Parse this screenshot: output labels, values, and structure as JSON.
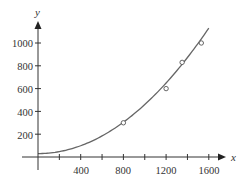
{
  "chart_data": {
    "type": "scatter",
    "title": "",
    "xlabel": "x",
    "ylabel": "y",
    "xlim": [
      0,
      1700
    ],
    "ylim": [
      0,
      1150
    ],
    "grid": false,
    "legend": null,
    "x_ticks": [
      200,
      400,
      600,
      800,
      1000,
      1200,
      1400,
      1600
    ],
    "x_tick_labels": [
      "400",
      "800",
      "1200",
      "1600"
    ],
    "y_ticks": [
      200,
      400,
      600,
      800,
      1000
    ],
    "y_tick_labels": [
      "200",
      "400",
      "600",
      "800",
      "1000"
    ],
    "series": [
      {
        "name": "data points",
        "type": "scatter",
        "marker": "open-circle",
        "x": [
          800,
          1200,
          1350,
          1530
        ],
        "y": [
          300,
          600,
          830,
          1000
        ]
      },
      {
        "name": "fitted curve",
        "type": "line",
        "model": "quadratic",
        "coefficients": {
          "a": 0.00043,
          "b": 0.0,
          "c": 30
        },
        "x_range": [
          0,
          1610
        ]
      }
    ]
  },
  "colors": {
    "axis": "#333333",
    "curve": "#666666",
    "marker": "#555555"
  },
  "axes": {
    "x_label": "x",
    "y_label": "y",
    "x_tick_labels": [
      {
        "value": 400,
        "label": "400"
      },
      {
        "value": 800,
        "label": "800"
      },
      {
        "value": 1200,
        "label": "1200"
      },
      {
        "value": 1600,
        "label": "1600"
      }
    ],
    "y_tick_labels": [
      {
        "value": 200,
        "label": "200"
      },
      {
        "value": 400,
        "label": "400"
      },
      {
        "value": 600,
        "label": "600"
      },
      {
        "value": 800,
        "label": "800"
      },
      {
        "value": 1000,
        "label": "1000"
      }
    ]
  }
}
